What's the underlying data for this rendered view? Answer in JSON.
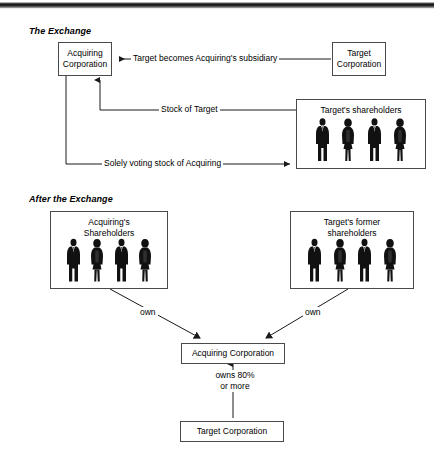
{
  "diagram": {
    "sections": [
      {
        "id": "exchange",
        "title": "The Exchange"
      },
      {
        "id": "after",
        "title": "After the Exchange"
      }
    ],
    "nodes": {
      "acquiring_top": "Acquiring\nCorporation",
      "acquiring_top_line1": "Acquiring",
      "acquiring_top_line2": "Corporation",
      "target_top_line1": "Target",
      "target_top_line2": "Corporation",
      "acquiring_bottom": "Acquiring Corporation",
      "target_bottom": "Target Corporation"
    },
    "groups": {
      "targets_shareholders": {
        "title": "Target's shareholders",
        "people": [
          "man",
          "woman",
          "man",
          "woman"
        ]
      },
      "acquirings_shareholders": {
        "title_line1": "Acquiring's",
        "title_line2": "Shareholders",
        "people": [
          "man",
          "woman",
          "man",
          "woman"
        ]
      },
      "targets_former_shareholders": {
        "title_line1": "Target's former",
        "title_line2": "shareholders",
        "people": [
          "man",
          "woman",
          "man",
          "woman"
        ]
      }
    },
    "edges": {
      "subsidiary": "Target becomes Acquiring's subsidiary",
      "stock_of_target": "Stock of Target",
      "solely_voting_stock": "Solely voting stock of Acquiring",
      "own_left": "own",
      "own_right": "own",
      "owns_line1": "owns 80%",
      "owns_line2": "or more"
    },
    "colors": {
      "stroke": "#4a4a4a",
      "wire": "#1a1a1a",
      "text": "#000000",
      "background": "#ffffff",
      "silhouette": "#111111"
    }
  }
}
